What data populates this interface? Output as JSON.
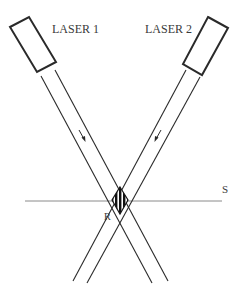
{
  "diagram": {
    "title": "",
    "labels": {
      "laser1": "LASER 1",
      "laser2": "LASER 2",
      "surface": "S",
      "region": "R"
    },
    "elements": [
      {
        "id": "laser1",
        "type": "laser-source",
        "label": "LASER 1",
        "beam_direction": "down-right"
      },
      {
        "id": "laser2",
        "type": "laser-source",
        "label": "LASER 2",
        "beam_direction": "down-left"
      },
      {
        "id": "beam1",
        "type": "beam",
        "from": "laser1",
        "arrow": "down-right"
      },
      {
        "id": "beam2",
        "type": "beam",
        "from": "laser2",
        "arrow": "down-left"
      },
      {
        "id": "surface",
        "type": "horizontal-line",
        "label": "S"
      },
      {
        "id": "region",
        "type": "interference-region",
        "label": "R",
        "pattern": "vertical fringes"
      }
    ],
    "colors": {
      "line": "#2a2a2a",
      "surface_line": "#8a8a8a",
      "text": "#3a3a3a",
      "background": "#ffffff"
    }
  }
}
